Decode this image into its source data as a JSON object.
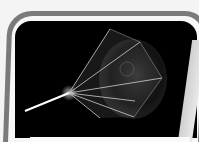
{
  "image": {
    "description": "Photo of a framed dark screen showing a bright light beam entering from the left and fanning out into a translucent cone of rays toward a glowing spherical shape on the right",
    "colors": {
      "frame": "#7a7a7a",
      "frame_inner": "#f7f7f7",
      "screen": "#000000",
      "beam": "#ffffff",
      "rays": "#c8c8c8"
    }
  }
}
